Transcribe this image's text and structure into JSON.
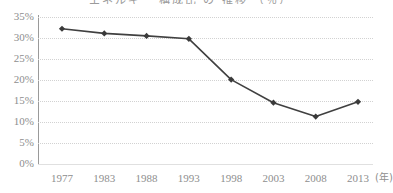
{
  "chart_data": {
    "type": "line",
    "title": "エネルギー 構成比 の 推移 （％）",
    "title_note": "title-cropped-at-top-edge",
    "categories": [
      "1977",
      "1983",
      "1988",
      "1993",
      "1998",
      "2003",
      "2008",
      "2013"
    ],
    "x": [
      1977,
      1983,
      1988,
      1993,
      1998,
      2003,
      2008,
      2013
    ],
    "values": [
      32.2,
      31.1,
      30.5,
      29.8,
      20.1,
      14.6,
      11.3,
      14.8
    ],
    "series": [
      {
        "name": "",
        "values": [
          32.2,
          31.1,
          30.5,
          29.8,
          20.1,
          14.6,
          11.3,
          14.8
        ]
      }
    ],
    "xlabel": "(年)",
    "ylabel": "",
    "ylim": [
      0,
      35
    ],
    "ytick_values": [
      35,
      30,
      25,
      20,
      15,
      10,
      5,
      0
    ],
    "ytick_labels": [
      "35%",
      "30%",
      "25%",
      "20%",
      "15%",
      "10%",
      "5%",
      "0%"
    ],
    "grid": true,
    "grid_style": "dotted-horizontal",
    "legend": "none",
    "marker": "diamond"
  },
  "style": {
    "line_color": "#404040",
    "marker_color": "#3a3a3a",
    "grid_color": "#d2d2d2",
    "axis_color": "#9a9a9a",
    "tick_label_color": "#8e8e8e",
    "background": "#ffffff"
  }
}
